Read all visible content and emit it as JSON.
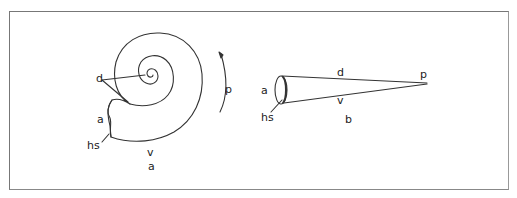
{
  "figure": {
    "panels": [
      {
        "id": "a",
        "caption": "a",
        "description": "coiled shell view",
        "labels": {
          "dorsal": "d",
          "aperture": "a",
          "hyponomic_sinus": "hs",
          "venter": "v",
          "posterior_direction": "p"
        }
      },
      {
        "id": "b",
        "caption": "b",
        "description": "uncoiled cone view",
        "labels": {
          "dorsal": "d",
          "aperture": "a",
          "hyponomic_sinus": "hs",
          "venter": "v",
          "apex": "p"
        }
      }
    ],
    "colors": {
      "line": "#333333",
      "frame": "#777777",
      "background": "#ffffff"
    }
  }
}
